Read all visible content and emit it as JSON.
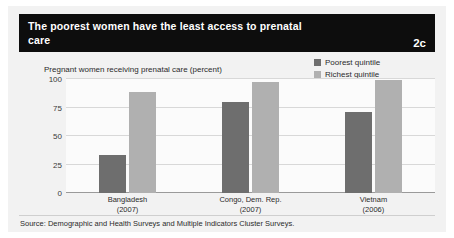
{
  "header": {
    "title": "The poorest women have the least access to prenatal care",
    "badge": "2c",
    "background_color": "#0d0d0d",
    "text_color": "#ffffff"
  },
  "legend": {
    "position": "top-right",
    "items": [
      {
        "label": "Poorest quintile",
        "color": "#6e6e6e"
      },
      {
        "label": "Richest quintile",
        "color": "#b0b0b0"
      }
    ]
  },
  "footer": {
    "source": "Source: Demographic and Health Surveys and Multiple Indicators Cluster Surveys."
  },
  "chart_data": {
    "type": "bar",
    "title": "The poorest women have the least access to prenatal care",
    "subtitle": "Pregnant women receiving prenatal care (percent)",
    "xlabel": "",
    "ylabel": "Pregnant women receiving prenatal care (percent)",
    "ylim": [
      0,
      100
    ],
    "yticks": [
      0,
      25,
      50,
      75,
      100
    ],
    "grid": true,
    "legend_position": "top-right",
    "categories": [
      "Bangladesh",
      "Congo, Dem. Rep.",
      "Vietnam"
    ],
    "category_years": [
      "(2007)",
      "(2007)",
      "(2006)"
    ],
    "series": [
      {
        "name": "Poorest quintile",
        "color": "#6e6e6e",
        "values": [
          33,
          80,
          71
        ]
      },
      {
        "name": "Richest quintile",
        "color": "#b0b0b0",
        "values": [
          89,
          97,
          99
        ]
      }
    ]
  }
}
